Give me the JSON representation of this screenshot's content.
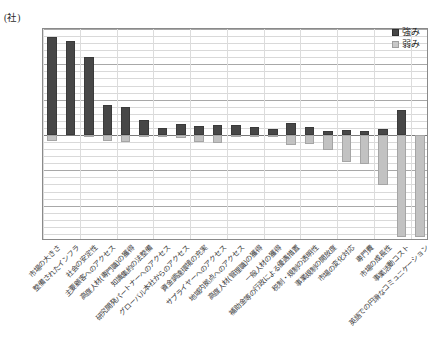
{
  "chart_data": {
    "type": "bar",
    "title": "",
    "subtitle": "",
    "xlabel": "",
    "ylabel": "",
    "yunit": "(社)",
    "ylim": [
      -150,
      150
    ],
    "ytick_labels": [
      "150",
      "100",
      "50",
      "0",
      "-50",
      "-100",
      "-150"
    ],
    "ytick_values": [
      150,
      100,
      50,
      0,
      -50,
      -100,
      -150
    ],
    "grid": true,
    "grid_minor_step": 10,
    "legend_position": "top-right",
    "legend": [
      "強み",
      "弱み"
    ],
    "colors": {
      "strength": "#474747",
      "weakness": "#c2c2c2",
      "axis": "#8a8a8a",
      "grid_minor": "#d9d9d9",
      "grid_major": "#a8a8a8"
    },
    "categories": [
      "市場の大きさ",
      "整備されたインフラ",
      "社会の安定性",
      "主要顧客へのアクセス",
      "高度人材(専門職)の獲得",
      "知識集約の法整備",
      "研究開発パートナーへのアクセス",
      "グローバル本社からのアクセス",
      "資金調達環境の充実",
      "サプライヤーへのアクセス",
      "地域内拠点へのアクセス",
      "高度人材(管理職)の獲得",
      "一般人材の獲得",
      "補助金等の行政による優遇措置",
      "税制・規制の透明性",
      "事業規制の開放度",
      "市場の変化対応",
      "専門費",
      "市場の成長性",
      "事業活動コスト",
      "英語での円滑なコミュニケーション"
    ],
    "series": [
      {
        "name": "強み",
        "values": [
          139,
          133,
          110,
          42,
          40,
          21,
          10,
          15,
          13,
          14,
          14,
          11,
          9,
          17,
          11,
          6,
          7,
          6,
          8,
          35,
          0
        ]
      },
      {
        "name": "弱み",
        "values": [
          -8,
          0,
          -1,
          -9,
          -10,
          -3,
          -2,
          -4,
          -10,
          -12,
          -3,
          -1,
          -1,
          -14,
          -13,
          -21,
          -38,
          -41,
          -71,
          -145,
          -144
        ]
      }
    ]
  }
}
